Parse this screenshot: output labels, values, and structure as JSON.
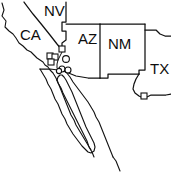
{
  "figure": {
    "width": 171,
    "height": 174,
    "background_color": "#ffffff",
    "line_color": "#111111"
  },
  "state_labels": [
    {
      "id": "nv",
      "text": "NV",
      "x": 44,
      "y": 16
    },
    {
      "id": "ca",
      "text": "CA",
      "x": 20,
      "y": 40
    },
    {
      "id": "az",
      "text": "AZ",
      "x": 78,
      "y": 44
    },
    {
      "id": "nm",
      "text": "NM",
      "x": 108,
      "y": 49
    },
    {
      "id": "tx",
      "text": "TX",
      "x": 152,
      "y": 74
    }
  ],
  "markers": {
    "squares": [
      {
        "id": "square-1",
        "x": 62,
        "y": 49,
        "size": 6
      },
      {
        "id": "square-2",
        "x": 50,
        "y": 56,
        "size": 6
      },
      {
        "id": "square-3",
        "x": 55,
        "y": 57,
        "size": 6
      },
      {
        "id": "square-4",
        "x": 51,
        "y": 62,
        "size": 6
      },
      {
        "id": "square-5",
        "x": 144,
        "y": 96,
        "size": 6
      }
    ],
    "circles": [
      {
        "id": "circle-1",
        "x": 66,
        "y": 59,
        "r": 3.4
      },
      {
        "id": "circle-2",
        "x": 62,
        "y": 69,
        "r": 3.0
      },
      {
        "id": "circle-3",
        "x": 68,
        "y": 70,
        "r": 3.0
      },
      {
        "id": "circle-4",
        "x": 59,
        "y": 71,
        "r": 2.6
      }
    ]
  },
  "legend": {
    "caption": "",
    "note": ""
  }
}
